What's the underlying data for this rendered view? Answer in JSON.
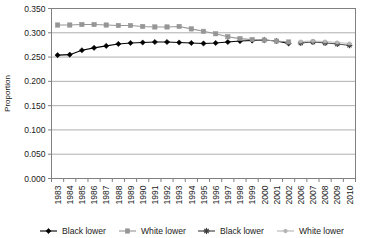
{
  "chart_data": {
    "type": "line",
    "title": "",
    "xlabel": "",
    "ylabel": "Proportion",
    "ylim": [
      0.0,
      0.35
    ],
    "ytick_values": [
      0.0,
      0.05,
      0.1,
      0.15,
      0.2,
      0.25,
      0.3,
      0.35
    ],
    "ytick_labels": [
      "0.000",
      "0.050",
      "0.100",
      "0.150",
      "0.200",
      "0.250",
      "0.300",
      "0.350"
    ],
    "grid": true,
    "grid_axis": "y",
    "legend_position": "bottom",
    "categories": [
      "1983",
      "1984",
      "1985",
      "1986",
      "1987",
      "1988",
      "1989",
      "1990",
      "1991",
      "1992",
      "1993",
      "1994",
      "1995",
      "1996",
      "1997",
      "1998",
      "1999",
      "2000",
      "2001",
      "2002",
      "2006",
      "2007",
      "2008",
      "2009",
      "2010"
    ],
    "series": [
      {
        "name": "Black lower",
        "color": "#000000",
        "marker": "diamond",
        "group": 1,
        "values": [
          0.254,
          0.255,
          0.264,
          0.269,
          0.273,
          0.277,
          0.279,
          0.28,
          0.281,
          0.281,
          0.28,
          0.279,
          0.278,
          0.279,
          0.281,
          0.283,
          0.284,
          0.285,
          0.283,
          0.278,
          null,
          null,
          null,
          null,
          null
        ]
      },
      {
        "name": "White lower",
        "color": "#969696",
        "marker": "square",
        "group": 1,
        "values": [
          0.316,
          0.316,
          0.317,
          0.317,
          0.316,
          0.315,
          0.315,
          0.313,
          0.312,
          0.312,
          0.313,
          0.308,
          0.303,
          0.298,
          0.292,
          0.288,
          0.286,
          0.285,
          0.283,
          0.281,
          null,
          null,
          null,
          null,
          null
        ]
      },
      {
        "name": "Black lower",
        "color": "#3a3a3a",
        "marker": "star",
        "group": 2,
        "values": [
          null,
          null,
          null,
          null,
          null,
          null,
          null,
          null,
          null,
          null,
          null,
          null,
          null,
          null,
          null,
          null,
          null,
          null,
          null,
          null,
          0.279,
          0.281,
          0.279,
          0.277,
          0.274
        ]
      },
      {
        "name": "White lower",
        "color": "#b4b4b4",
        "marker": "dot",
        "group": 2,
        "values": [
          null,
          null,
          null,
          null,
          null,
          null,
          null,
          null,
          null,
          null,
          null,
          null,
          null,
          null,
          null,
          null,
          null,
          null,
          null,
          null,
          0.282,
          0.283,
          0.282,
          0.28,
          0.278
        ]
      }
    ]
  },
  "legend": {
    "entries": [
      {
        "label": "Black lower",
        "color": "#000000",
        "marker": "diamond"
      },
      {
        "label": "White lower",
        "color": "#969696",
        "marker": "square"
      },
      {
        "label": "Black lower",
        "color": "#3a3a3a",
        "marker": "star"
      },
      {
        "label": "White lower",
        "color": "#b4b4b4",
        "marker": "dot"
      }
    ]
  },
  "colors": {
    "plot_border": "#808080",
    "gridline": "#a6a6a6",
    "axis": "#808080",
    "background": "#ffffff",
    "text": "#1a1a1a"
  }
}
